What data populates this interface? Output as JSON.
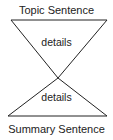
{
  "diagram": {
    "top_label": "Topic Sentence",
    "upper_triangle_label": "details",
    "lower_triangle_label": "details",
    "bottom_label": "Summary Sentence",
    "line_color": "#222222"
  }
}
